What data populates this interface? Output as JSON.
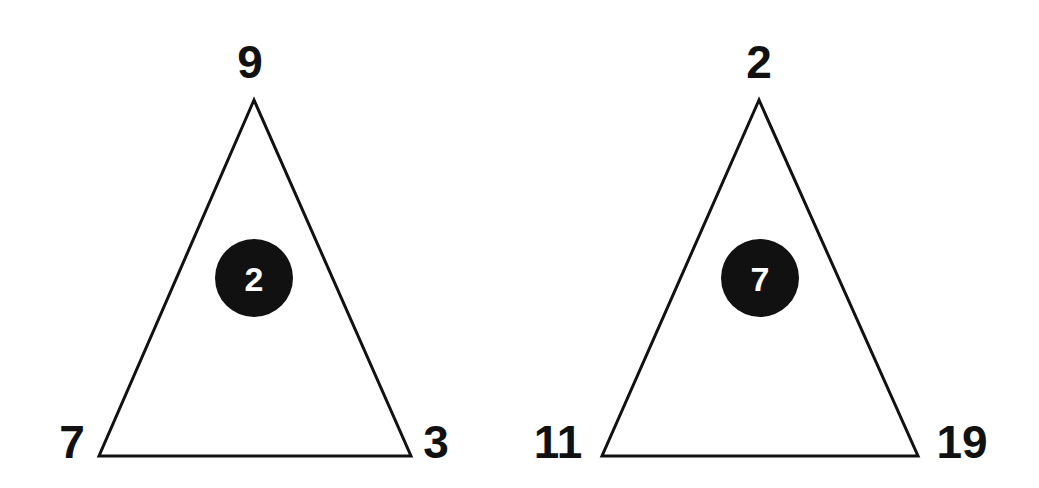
{
  "colors": {
    "background": "#ffffff",
    "stroke": "#111111",
    "circle_fill": "#111111",
    "center_text": "#ffffff"
  },
  "triangles": [
    {
      "top": "9",
      "bottom_left": "7",
      "bottom_right": "3",
      "center": "2"
    },
    {
      "top": "2",
      "bottom_left": "11",
      "bottom_right": "19",
      "center": "7"
    }
  ]
}
